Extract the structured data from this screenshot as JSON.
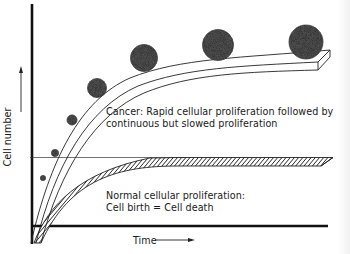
{
  "figure": {
    "type": "conceptual growth curve diagram",
    "y_axis_label": "Cell number",
    "x_axis_label": "Time",
    "cancer_curve": {
      "label_line1": "Cancer: Rapid cellular proliferation followed by",
      "label_line2": "continuous but slowed proliferation",
      "style": "open ribbon with increasing-size stippled spheres (tumor masses)"
    },
    "normal_curve": {
      "label_line1": "Normal cellular proliferation:",
      "label_line2": "Cell birth = Cell death",
      "style": "hatched ribbon reaching a plateau"
    },
    "colors": {
      "ink": "#1a1a1a",
      "background": "#ffffff",
      "stipple": "#3a3a3a"
    }
  }
}
